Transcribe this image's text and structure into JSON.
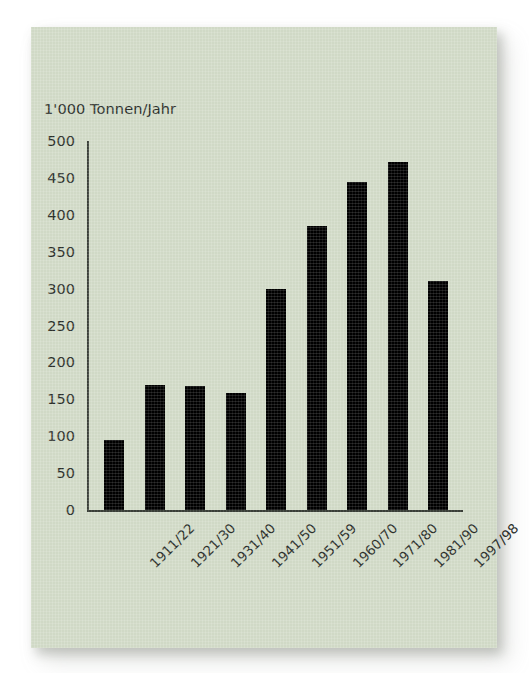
{
  "card": {
    "background_color": "#d3dcc9",
    "bar_color": "#000000",
    "text_color": "#2b2f2a"
  },
  "chart_data": {
    "type": "bar",
    "title": "",
    "ylabel": "1'000 Tonnen/Jahr",
    "xlabel": "",
    "ylim": [
      0,
      500
    ],
    "ytick_step": 50,
    "yticks": [
      500,
      450,
      400,
      350,
      300,
      250,
      200,
      150,
      100,
      50,
      0
    ],
    "ytick_labels": [
      "500",
      "450",
      "400",
      "350",
      "300",
      "250",
      "200",
      "150",
      "100",
      "50",
      "0"
    ],
    "grid": false,
    "legend": null,
    "categories": [
      "1911/22",
      "1921/30",
      "1931/40",
      "1941/50",
      "1951/59",
      "1960/70",
      "1971/80",
      "1981/90",
      "1997/98"
    ],
    "values": [
      95,
      170,
      168,
      158,
      300,
      385,
      445,
      472,
      310
    ]
  }
}
